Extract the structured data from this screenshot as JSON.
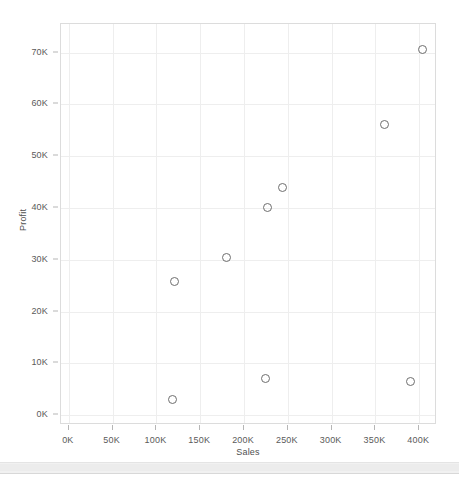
{
  "chart_data": {
    "type": "scatter",
    "title": "",
    "xlabel": "Sales",
    "ylabel": "Profit",
    "xlim": [
      -9000,
      418000
    ],
    "ylim": [
      -1500,
      75500
    ],
    "grid": true,
    "legend": "none",
    "x_tick_labels": [
      "0K",
      "50K",
      "100K",
      "150K",
      "200K",
      "250K",
      "300K",
      "350K",
      "400K"
    ],
    "x_tick_values": [
      0,
      50000,
      100000,
      150000,
      200000,
      250000,
      300000,
      350000,
      400000
    ],
    "y_tick_labels": [
      "0K",
      "10K",
      "20K",
      "30K",
      "40K",
      "50K",
      "60K",
      "70K"
    ],
    "y_tick_values": [
      0,
      10000,
      20000,
      30000,
      40000,
      50000,
      60000,
      70000
    ],
    "marker": "open-circle",
    "marker_color": "#6e6e6e",
    "points": [
      {
        "x": 118000,
        "y": 3000
      },
      {
        "x": 121000,
        "y": 25800
      },
      {
        "x": 180000,
        "y": 30400
      },
      {
        "x": 225000,
        "y": 7000
      },
      {
        "x": 227000,
        "y": 40000
      },
      {
        "x": 244000,
        "y": 44000
      },
      {
        "x": 360000,
        "y": 56200
      },
      {
        "x": 390000,
        "y": 6600
      },
      {
        "x": 404000,
        "y": 70600
      }
    ]
  },
  "axes": {
    "y_title": "Profit",
    "x_title": "Sales"
  },
  "colors": {
    "mark_stroke": "#6e6e6e",
    "gridline": "#eeeeee",
    "border": "#dcdcdc",
    "tick_text": "#5a5a5a",
    "axis_title_text": "#4f4f4f",
    "scrollbar": "#f1f1f1"
  }
}
